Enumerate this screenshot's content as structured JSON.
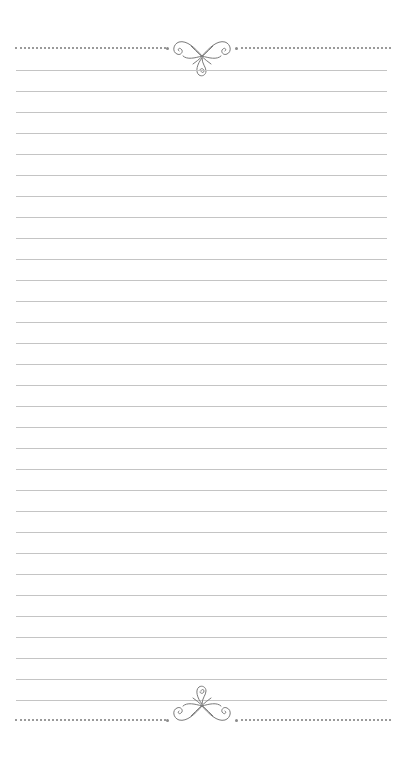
{
  "page": {
    "type": "lined-notepaper",
    "background_color": "#ffffff",
    "rule_color": "#c4c4c4",
    "dotted_color": "#9a9a9a",
    "ornament_color": "#7a7a7a",
    "line_count": 31,
    "first_line_y": 70,
    "line_spacing": 21,
    "top_border": {
      "style": "dotted",
      "y": 47,
      "ornament": "flourish-icon"
    },
    "bottom_border": {
      "style": "dotted",
      "y": 719,
      "ornament": "flourish-icon"
    }
  }
}
